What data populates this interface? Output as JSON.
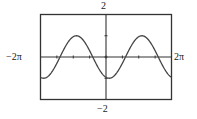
{
  "chart_data": {
    "type": "line",
    "title": "",
    "xlabel": "",
    "ylabel": "",
    "xlim_label": [
      "-2π",
      "2π"
    ],
    "ylim_label": [
      "-2",
      "2"
    ],
    "xlim": [
      -6.2832,
      6.2832
    ],
    "ylim": [
      -2,
      2
    ],
    "x_tick_step": 1.5708,
    "y_tick_step": 1,
    "grid": false,
    "legend": null,
    "series": [
      {
        "name": "y = -cos(x - 0.3) (graphing-calculator trace, amplitude 1, period 2π)",
        "amplitude": 1,
        "period": 6.2832,
        "phase_shift": 0.3,
        "form": "-cos",
        "x": [
          -6.2832,
          -5.4978,
          -4.7124,
          -3.927,
          -3.1416,
          -2.3562,
          -1.5708,
          -0.7854,
          0,
          0.7854,
          1.5708,
          2.3562,
          3.1416,
          3.927,
          4.7124,
          5.4978,
          6.2832
        ],
        "y": [
          -0.96,
          -0.5,
          0.3,
          0.89,
          0.96,
          0.5,
          -0.3,
          -0.89,
          -0.96,
          -0.5,
          0.3,
          0.89,
          0.96,
          0.5,
          -0.3,
          -0.89,
          -0.96
        ]
      }
    ]
  },
  "labels": {
    "y_max": "2",
    "y_min": "−2",
    "x_min": "−2π",
    "x_max": "2π"
  },
  "colors": {
    "frame": "#333333",
    "curve": "#444444",
    "axis": "#333333"
  }
}
